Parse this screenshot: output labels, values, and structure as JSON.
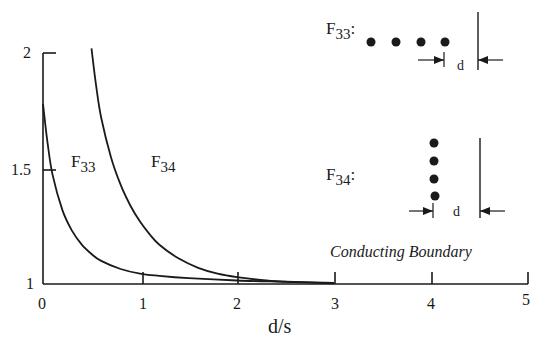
{
  "chart_data": {
    "type": "line",
    "title": "",
    "xlabel": "d/s",
    "ylabel": "",
    "xlim": [
      0,
      5
    ],
    "ylim": [
      1,
      2
    ],
    "grid": false,
    "legend": "inline labels",
    "x_ticks": [
      "0",
      "1",
      "2",
      "3",
      "4",
      "5"
    ],
    "y_ticks": [
      "1",
      "1.5",
      "2"
    ],
    "series": [
      {
        "name": "F33",
        "label_main": "F",
        "label_sub": "33",
        "x": [
          0.0,
          0.05,
          0.1,
          0.2,
          0.3,
          0.4,
          0.5,
          0.6,
          0.8,
          1.0,
          1.2,
          1.5,
          2.0,
          2.5,
          3.0
        ],
        "y": [
          1.78,
          1.6,
          1.47,
          1.32,
          1.23,
          1.17,
          1.13,
          1.1,
          1.065,
          1.045,
          1.035,
          1.025,
          1.015,
          1.01,
          1.005
        ]
      },
      {
        "name": "F34",
        "label_main": "F",
        "label_sub": "34",
        "x": [
          0.5,
          0.55,
          0.6,
          0.7,
          0.8,
          0.9,
          1.0,
          1.1,
          1.2,
          1.4,
          1.6,
          1.8,
          2.0,
          2.3,
          2.6,
          3.0
        ],
        "y": [
          2.02,
          1.85,
          1.72,
          1.55,
          1.43,
          1.34,
          1.27,
          1.215,
          1.17,
          1.11,
          1.07,
          1.045,
          1.03,
          1.015,
          1.008,
          1.003
        ]
      }
    ],
    "annotations": [
      "Conducting Boundary",
      "F33: four charges in a row parallel to the boundary at distance d",
      "F34: four charges in a column perpendicular, nearest at distance d"
    ]
  },
  "labels": {
    "xlabel": "d/s",
    "y_ticks": {
      "t1": "1",
      "t15": "1.5",
      "t2": "2"
    },
    "x_ticks": {
      "t0": "0",
      "t1": "1",
      "t2": "2",
      "t3": "3",
      "t4": "4",
      "t5": "5"
    },
    "curve_f33": {
      "main": "F",
      "sub": "33"
    },
    "curve_f34": {
      "main": "F",
      "sub": "34"
    },
    "boundary": "Conducting Boundary",
    "diagram_f33": {
      "main": "F",
      "sub": "33",
      "colon": ":",
      "d": "d"
    },
    "diagram_f34": {
      "main": "F",
      "sub": "34",
      "colon": ":",
      "d": "d"
    }
  },
  "colors": {
    "ink": "#1a1a1a",
    "background": "#ffffff"
  }
}
